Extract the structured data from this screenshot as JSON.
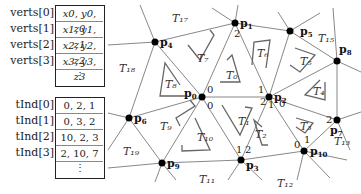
{
  "verts": {
    "labels": [
      "verts[0]",
      "verts[1]",
      "verts[2]",
      "verts[3]"
    ],
    "values": [
      "x0, y0, z0",
      "x1, y1, z1",
      "x2, y2, z2",
      "x3, y3, z3"
    ],
    "ellipsis": "⋮"
  },
  "tInd": {
    "labels": [
      "tInd[0]",
      "tInd[1]",
      "tInd[2]",
      "tInd[3]"
    ],
    "values": [
      "0, 2, 1",
      "0, 3, 2",
      "10, 2, 3",
      "2, 10, 7"
    ],
    "ellipsis": "⋮"
  },
  "mesh": {
    "points": [
      {
        "name": "p0",
        "x": 202,
        "y": 97
      },
      {
        "name": "p1",
        "x": 235,
        "y": 23
      },
      {
        "name": "p2",
        "x": 269,
        "y": 97
      },
      {
        "name": "p3",
        "x": 241,
        "y": 160
      },
      {
        "name": "p4",
        "x": 155,
        "y": 42
      },
      {
        "name": "p5",
        "x": 290,
        "y": 31
      },
      {
        "name": "p6",
        "x": 129,
        "y": 118
      },
      {
        "name": "p7",
        "x": 337,
        "y": 120
      },
      {
        "name": "p8",
        "x": 337,
        "y": 61
      },
      {
        "name": "p9",
        "x": 162,
        "y": 163
      },
      {
        "name": "p10",
        "x": 304,
        "y": 151
      }
    ],
    "triangles": [
      "T0",
      "T1",
      "T2",
      "T3",
      "T4",
      "T5",
      "T6",
      "T7",
      "T8",
      "T9",
      "T10",
      "T11",
      "T12",
      "T13",
      "T15",
      "T17",
      "T18",
      "T19"
    ]
  }
}
